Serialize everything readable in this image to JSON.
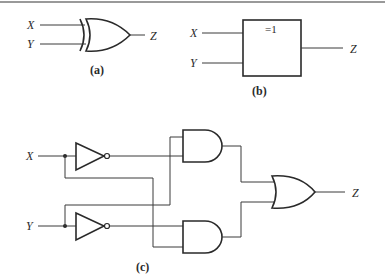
{
  "figure": {
    "top_rule": true,
    "panel_a": {
      "caption": "(a)",
      "gate_type": "XOR (distinctive shape)",
      "inputs": [
        "X",
        "Y"
      ],
      "output": "Z"
    },
    "panel_b": {
      "caption": "(b)",
      "gate_type": "XOR (IEC rectangular)",
      "box_symbol": "=1",
      "inputs": [
        "X",
        "Y"
      ],
      "output": "Z"
    },
    "panel_c": {
      "caption": "(c)",
      "gate_type": "XOR from NOT/AND/OR",
      "inputs": [
        "X",
        "Y"
      ],
      "output": "Z",
      "components": [
        "NOT gate (X)",
        "NOT gate (Y)",
        "AND gate 1",
        "AND gate 2",
        "OR gate"
      ]
    }
  },
  "colors": {
    "line": "#2a2a2a",
    "background": "#ffffff"
  }
}
